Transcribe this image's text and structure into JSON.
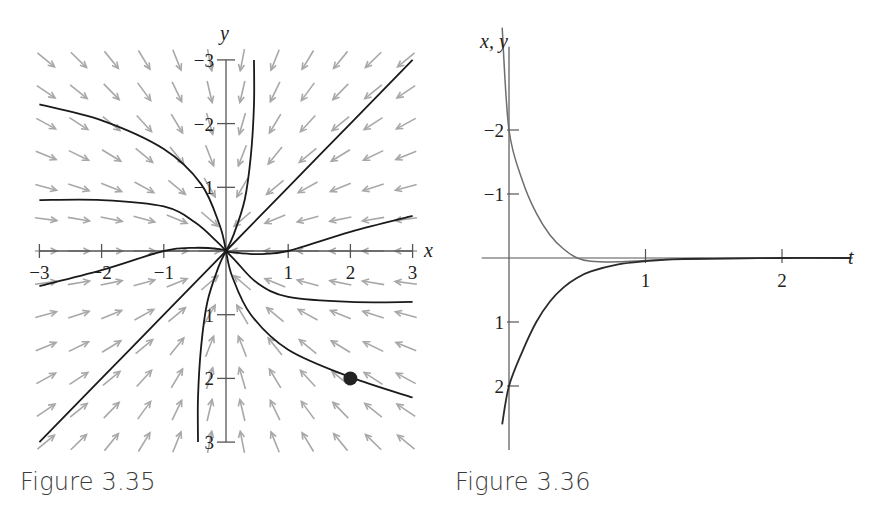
{
  "figures": [
    {
      "caption": "Figure 3.35",
      "x_axis_label": "x",
      "y_axis_label": "y",
      "x_ticks": [
        "−3",
        "−2",
        "−1",
        "1",
        "2",
        "3"
      ],
      "y_ticks": [
        "3",
        "2",
        "1",
        "−1",
        "−2",
        "−3"
      ]
    },
    {
      "caption": "Figure 3.36",
      "x_axis_label": "t",
      "y_axis_label": "x, y",
      "x_ticks": [
        "1",
        "2"
      ],
      "y_ticks": [
        "2",
        "1",
        "−1",
        "−2"
      ]
    }
  ],
  "colors": {
    "axis": "#555555",
    "solution": "#1a1a1a",
    "field_arrow": "#a8a8a8",
    "x_curve": "#6e6e6e",
    "y_curve": "#2a2a2a",
    "marker": "#222222"
  },
  "chart_data": [
    {
      "type": "scatter",
      "title": "Figure 3.35",
      "subtitle": "Phase plane: direction field with solution curves approaching a sink at the origin",
      "xlabel": "x",
      "ylabel": "y",
      "xlim": [
        -3,
        3
      ],
      "ylim": [
        -3,
        3
      ],
      "x_tick_values": [
        -3,
        -2,
        -1,
        1,
        2,
        3
      ],
      "y_tick_values": [
        -3,
        -2,
        -1,
        1,
        2,
        3
      ],
      "grid": false,
      "legend": "none",
      "direction_field": {
        "x_range": [
          -3,
          3
        ],
        "y_range": [
          -3,
          3
        ],
        "columns": 12,
        "rows": 13,
        "description": "gray arrows pointing toward the origin"
      },
      "solution_curves": [
        {
          "name": "upper-left curve",
          "points": [
            [
              -3,
              2.3
            ],
            [
              -2,
              2.05
            ],
            [
              -1,
              1.6
            ],
            [
              -0.4,
              1.05
            ],
            [
              -0.1,
              0.4
            ],
            [
              0,
              0
            ]
          ]
        },
        {
          "name": "left curve",
          "points": [
            [
              -3,
              0.8
            ],
            [
              -2,
              0.8
            ],
            [
              -1,
              0.7
            ],
            [
              -0.5,
              0.45
            ],
            [
              -0.15,
              0.15
            ],
            [
              0,
              0
            ]
          ]
        },
        {
          "name": "left-lower curve",
          "points": [
            [
              -3,
              -0.55
            ],
            [
              -2,
              -0.3
            ],
            [
              -1,
              0
            ],
            [
              -0.5,
              0.05
            ],
            [
              -0.1,
              0.03
            ],
            [
              0,
              0
            ]
          ]
        },
        {
          "name": "upper curve",
          "points": [
            [
              0.45,
              3
            ],
            [
              0.45,
              2.3
            ],
            [
              0.4,
              1.5
            ],
            [
              0.3,
              0.8
            ],
            [
              0.12,
              0.25
            ],
            [
              0,
              0
            ]
          ]
        },
        {
          "name": "upper-right line",
          "points": [
            [
              3,
              3
            ],
            [
              1.5,
              1.5
            ],
            [
              0,
              0
            ]
          ]
        },
        {
          "name": "right curve",
          "points": [
            [
              3,
              0.55
            ],
            [
              2,
              0.3
            ],
            [
              1,
              0
            ],
            [
              0.5,
              -0.05
            ],
            [
              0.1,
              -0.02
            ],
            [
              0,
              0
            ]
          ]
        },
        {
          "name": "right-lower curve",
          "points": [
            [
              3,
              -0.8
            ],
            [
              2,
              -0.8
            ],
            [
              1,
              -0.72
            ],
            [
              0.5,
              -0.5
            ],
            [
              0.15,
              -0.15
            ],
            [
              0,
              0
            ]
          ]
        },
        {
          "name": "curve through marked point",
          "points": [
            [
              3,
              -2.3
            ],
            [
              2,
              -1.98
            ],
            [
              1,
              -1.55
            ],
            [
              0.4,
              -1.0
            ],
            [
              0.1,
              -0.4
            ],
            [
              0,
              0
            ]
          ]
        },
        {
          "name": "lower curve",
          "points": [
            [
              -0.45,
              -3
            ],
            [
              -0.45,
              -2.3
            ],
            [
              -0.4,
              -1.5
            ],
            [
              -0.3,
              -0.8
            ],
            [
              -0.12,
              -0.25
            ],
            [
              0,
              0
            ]
          ]
        },
        {
          "name": "lower-left line",
          "points": [
            [
              -3,
              -3
            ],
            [
              -1.5,
              -1.5
            ],
            [
              0,
              0
            ]
          ]
        }
      ],
      "marked_point": {
        "x": 2,
        "y": -2
      }
    },
    {
      "type": "line",
      "title": "Figure 3.36",
      "subtitle": "x(t) and y(t) for the solution through (2, −2)",
      "xlabel": "t",
      "ylabel": "x, y",
      "xlim": [
        -0.1,
        2.6
      ],
      "ylim": [
        -2.7,
        3.3
      ],
      "x_tick_values": [
        1,
        2
      ],
      "y_tick_values": [
        -2,
        -1,
        1,
        2
      ],
      "grid": false,
      "legend": "none",
      "x": [
        -0.05,
        0,
        0.1,
        0.2,
        0.3,
        0.4,
        0.5,
        0.6,
        0.8,
        1.0,
        1.2,
        1.5,
        2.0,
        2.5
      ],
      "series": [
        {
          "name": "x(t)",
          "values": [
            3.6,
            2.0,
            1.2,
            0.7,
            0.36,
            0.14,
            0.0,
            -0.05,
            -0.06,
            -0.04,
            -0.02,
            -0.01,
            0.0,
            0.0
          ]
        },
        {
          "name": "y(t)",
          "values": [
            -2.6,
            -2.0,
            -1.45,
            -1.0,
            -0.68,
            -0.46,
            -0.31,
            -0.21,
            -0.1,
            -0.05,
            -0.02,
            -0.01,
            0.0,
            0.0
          ]
        }
      ]
    }
  ]
}
